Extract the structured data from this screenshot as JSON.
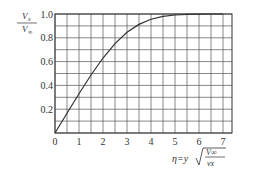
{
  "chart_data": {
    "type": "line",
    "title": "",
    "xlabel": "η=y√(V∞/νx)",
    "ylabel": "Vx/V∞",
    "xlim": [
      0,
      7.4
    ],
    "ylim": [
      0,
      1.0
    ],
    "grid": true,
    "x_ticks": [
      0,
      1,
      2,
      3,
      4,
      5,
      6,
      7
    ],
    "y_ticks": [
      0.2,
      0.4,
      0.6,
      0.8,
      1.0
    ],
    "series": [
      {
        "name": "Blasius velocity profile",
        "x": [
          0,
          0.5,
          1.0,
          1.5,
          2.0,
          2.5,
          3.0,
          3.5,
          4.0,
          4.5,
          5.0,
          5.5,
          6.0,
          6.5,
          7.0
        ],
        "values": [
          0,
          0.166,
          0.33,
          0.487,
          0.63,
          0.751,
          0.846,
          0.913,
          0.956,
          0.98,
          0.992,
          0.997,
          0.999,
          1.0,
          1.0
        ]
      }
    ]
  },
  "labels": {
    "y_num": "V",
    "y_num_sub": "x",
    "y_den": "V",
    "y_den_sub": "∞",
    "x_label": "η=y",
    "x_num": "V∞",
    "x_den": "νx"
  }
}
